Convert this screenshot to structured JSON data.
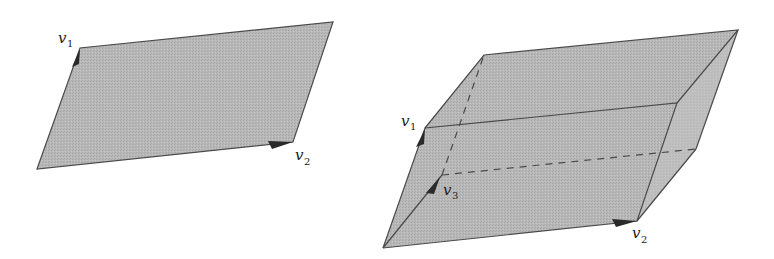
{
  "figures": [
    {
      "name": "parallelogram",
      "labels": {
        "v1": "v",
        "v1_sub": "1",
        "v2": "v",
        "v2_sub": "2"
      }
    },
    {
      "name": "parallelepiped",
      "labels": {
        "v1": "v",
        "v1_sub": "1",
        "v2": "v",
        "v2_sub": "2",
        "v3": "v",
        "v3_sub": "3"
      }
    }
  ],
  "colors": {
    "fill": "#b4b4b4",
    "fill_side": "#c2c2c2",
    "edge": "#4a4a4a",
    "arrow": "#2a2a2a"
  }
}
